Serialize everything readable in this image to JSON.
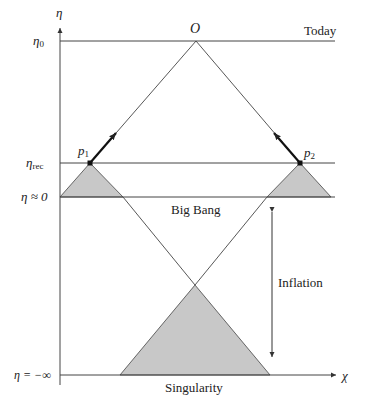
{
  "diagram": {
    "axes": {
      "vertical": {
        "symbol": "η"
      },
      "horizontal": {
        "symbol": "χ"
      }
    },
    "levels": [
      {
        "id": "eta0",
        "label_base": "η",
        "label_sub": "0",
        "right_label": "Today"
      },
      {
        "id": "eta_rec",
        "label_base": "η",
        "label_sub": "rec",
        "right_label": ""
      },
      {
        "id": "eta_zero",
        "label": "η ≈ 0",
        "center_label": "Big Bang"
      },
      {
        "id": "eta_minus_inf",
        "label": "η = −∞",
        "center_label": "Singularity"
      }
    ],
    "observer": {
      "label": "O"
    },
    "points": [
      {
        "id": "p1",
        "base": "p",
        "sub": "1"
      },
      {
        "id": "p2",
        "base": "p",
        "sub": "2"
      }
    ],
    "annotations": {
      "inflation": "Inflation"
    },
    "colors": {
      "line": "#333333",
      "fill": "#c8c8c8",
      "background": "#ffffff"
    }
  }
}
